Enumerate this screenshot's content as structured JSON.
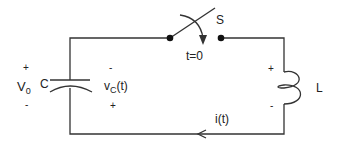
{
  "labels": {
    "source_voltage": "V",
    "source_voltage_sub": "0",
    "source_plus": "+",
    "source_minus": "-",
    "capacitor": "C",
    "cap_voltage": "v",
    "cap_voltage_sub": "C",
    "cap_voltage_arg": "(t)",
    "cap_minus": "-",
    "cap_plus": "+",
    "switch": "S",
    "switch_time": "t=0",
    "inductor": "L",
    "ind_plus": "+",
    "ind_minus": "-",
    "current": "i(t)"
  },
  "colors": {
    "wire": "#333333",
    "text": "#222222"
  }
}
